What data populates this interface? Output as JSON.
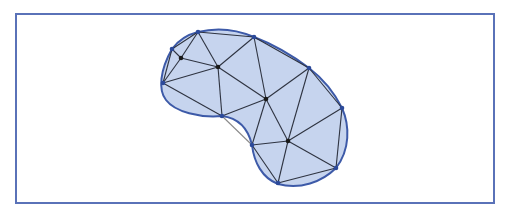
{
  "diagram": {
    "type": "triangulated-mesh",
    "colors": {
      "background": "#ffffff",
      "frame": "#5a72b8",
      "fill": "#c6d4ee",
      "boundary": "#3d5aa8",
      "edge": "#2e3340",
      "outside_edge": "#8a8a8a",
      "boundary_node": "#2c4a9a",
      "interior_node": "#1a1a1a"
    },
    "frame": {
      "x": 16,
      "y": 14,
      "width": 478,
      "height": 189
    },
    "boundary_path": "M198,32 C222,26 240,31 254,37 C275,45 293,56 309,68 C322,78 334,92 342,108 C350,126 350,150 336,168 C322,182 300,190 278,184 C262,178 254,162 252,145 C248,128 238,118 222,116 C200,118 175,112 166,100 C158,90 160,70 172,49 C180,38 190,34 198,32 Z",
    "nodes": [
      {
        "id": 0,
        "x": 198,
        "y": 32,
        "kind": "boundary"
      },
      {
        "id": 1,
        "x": 254,
        "y": 37,
        "kind": "boundary"
      },
      {
        "id": 2,
        "x": 172,
        "y": 49,
        "kind": "boundary"
      },
      {
        "id": 3,
        "x": 181,
        "y": 58,
        "kind": "interior"
      },
      {
        "id": 4,
        "x": 218,
        "y": 67,
        "kind": "interior"
      },
      {
        "id": 5,
        "x": 163,
        "y": 83,
        "kind": "boundary"
      },
      {
        "id": 6,
        "x": 309,
        "y": 68,
        "kind": "boundary"
      },
      {
        "id": 7,
        "x": 266,
        "y": 99,
        "kind": "interior"
      },
      {
        "id": 8,
        "x": 222,
        "y": 116,
        "kind": "boundary"
      },
      {
        "id": 9,
        "x": 342,
        "y": 108,
        "kind": "boundary"
      },
      {
        "id": 10,
        "x": 288,
        "y": 141,
        "kind": "interior"
      },
      {
        "id": 11,
        "x": 252,
        "y": 145,
        "kind": "boundary"
      },
      {
        "id": 12,
        "x": 336,
        "y": 168,
        "kind": "boundary"
      },
      {
        "id": 13,
        "x": 278,
        "y": 183,
        "kind": "boundary"
      }
    ],
    "edges": [
      [
        0,
        1
      ],
      [
        0,
        2
      ],
      [
        0,
        3
      ],
      [
        0,
        4
      ],
      [
        2,
        3
      ],
      [
        2,
        5
      ],
      [
        3,
        4
      ],
      [
        3,
        5
      ],
      [
        5,
        4
      ],
      [
        5,
        8
      ],
      [
        4,
        1
      ],
      [
        4,
        8
      ],
      [
        4,
        7
      ],
      [
        1,
        6
      ],
      [
        1,
        7
      ],
      [
        6,
        7
      ],
      [
        6,
        9
      ],
      [
        6,
        10
      ],
      [
        8,
        7
      ],
      [
        7,
        11
      ],
      [
        7,
        10
      ],
      [
        9,
        10
      ],
      [
        9,
        12
      ],
      [
        11,
        10
      ],
      [
        11,
        13
      ],
      [
        10,
        13
      ],
      [
        10,
        12
      ],
      [
        13,
        12
      ]
    ],
    "outside_edges": [
      [
        8,
        11
      ]
    ]
  }
}
